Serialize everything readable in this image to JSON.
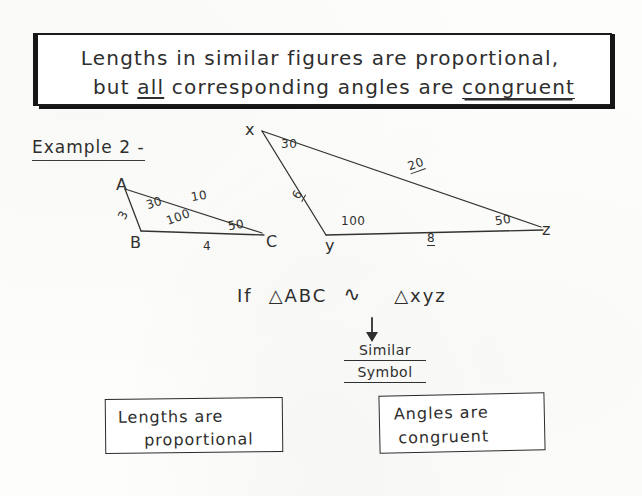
{
  "header": {
    "line1": "Lengths in similar figures are proportional,",
    "line2_before": "but ",
    "line2_emph": "all",
    "line2_middle": " corresponding angles are ",
    "line2_strong": "congruent"
  },
  "example": {
    "label": "Example 2 -"
  },
  "figures": {
    "triangle_abc": {
      "name": "triangle-abc",
      "vertices": [
        {
          "label": "A",
          "x": 128,
          "y": 183
        },
        {
          "label": "B",
          "x": 135,
          "y": 239
        },
        {
          "label": "C",
          "x": 269,
          "y": 239
        }
      ],
      "angles": [
        {
          "at": "A",
          "value": "30"
        },
        {
          "at": "B",
          "value": "100"
        },
        {
          "at": "C",
          "value": "50"
        }
      ],
      "sides": [
        {
          "between": "AC",
          "value": "10"
        },
        {
          "between": "AB",
          "value": "3"
        },
        {
          "between": "BC",
          "value": "4"
        }
      ]
    },
    "triangle_xyz": {
      "name": "triangle-xyz",
      "vertices": [
        {
          "label": "x",
          "x": 250,
          "y": 128
        },
        {
          "label": "y",
          "x": 330,
          "y": 242
        },
        {
          "label": "z",
          "x": 545,
          "y": 229
        }
      ],
      "angles": [
        {
          "at": "x",
          "value": "30"
        },
        {
          "at": "y",
          "value": "100"
        },
        {
          "at": "z",
          "value": "50"
        }
      ],
      "sides": [
        {
          "between": "xz",
          "value": "20"
        },
        {
          "between": "xy",
          "value": "6"
        },
        {
          "between": "yz",
          "value": "8"
        }
      ]
    }
  },
  "statement": {
    "if_word": "If",
    "triangle_symbol": "△",
    "left_triangle": "ABC",
    "similar_symbol": "∿",
    "right_triangle": "xyz"
  },
  "annotation": {
    "arrow": "arrow-down",
    "note_line1": "Similar",
    "note_line2": "Symbol"
  },
  "conclusions": [
    {
      "name": "lengths-box",
      "line1": "Lengths are",
      "line2": "proportional"
    },
    {
      "name": "angles-box",
      "line1": "Angles  are",
      "line2": "congruent"
    }
  ],
  "colors": {
    "ink": "#2e2e2e",
    "paper": "#fdfdfb",
    "banner_border": "#1b1b1b"
  }
}
